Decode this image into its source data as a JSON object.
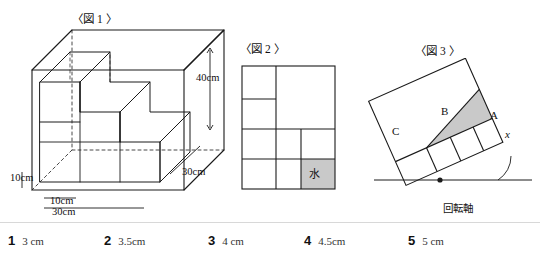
{
  "figures": [
    {
      "id": "fig1",
      "label": "〈図 1 〉",
      "dimensions": [
        {
          "text": "40cm"
        },
        {
          "text": "30cm"
        },
        {
          "text": "10cm"
        },
        {
          "text": "10cm"
        },
        {
          "text": "30cm"
        }
      ]
    },
    {
      "id": "fig2",
      "label": "〈図 2 〉",
      "water_cell": "水"
    },
    {
      "id": "fig3",
      "label": "〈図 3 〉",
      "marks": [
        {
          "text": "C"
        },
        {
          "text": "B"
        },
        {
          "text": "A"
        },
        {
          "text": "x"
        }
      ],
      "axis_label": "回転軸"
    }
  ],
  "choices": [
    {
      "num": "1",
      "value": "3 cm"
    },
    {
      "num": "2",
      "value": "3.5cm"
    },
    {
      "num": "3",
      "value": "4 cm"
    },
    {
      "num": "4",
      "value": "4.5cm"
    },
    {
      "num": "5",
      "value": "5 cm"
    }
  ],
  "colors": {
    "line": "#1a1a1a",
    "shade": "#c9c9c9",
    "rule": "#d8d8d8"
  }
}
